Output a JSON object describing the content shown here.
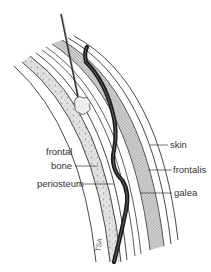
{
  "diagram": {
    "labels": {
      "skin": "skin",
      "frontalis": "frontalis",
      "galea": "galea",
      "frontal_bone_line1": "frontal",
      "frontal_bone_line2": "bone",
      "periosteum": "periosteum"
    },
    "signature": "TSA",
    "colors": {
      "line": "#333333",
      "bone_fill": "#d9d9d9",
      "muscle_fill": "#bdbdbd",
      "drain": "#1a1a1a",
      "background": "#ffffff"
    }
  }
}
